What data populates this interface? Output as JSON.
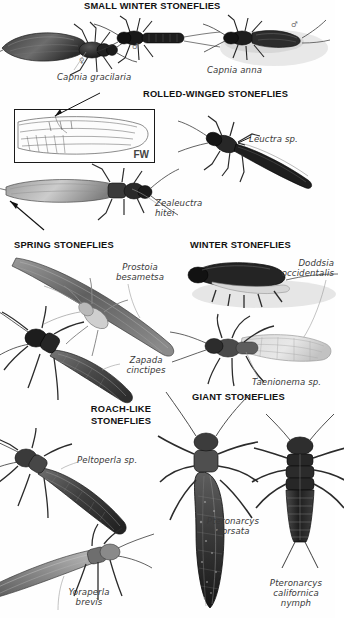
{
  "plate": {
    "title": "Stonefly families plate",
    "background_color": "#ffffff",
    "ink_color": "#1a1a1a",
    "label_color": "#3a3a3a"
  },
  "sections": [
    {
      "id": "small-winter",
      "heading": "SMALL WINTER STONEFLIES"
    },
    {
      "id": "rolled-winged",
      "heading": "ROLLED-WINGED STONEFLIES"
    },
    {
      "id": "spring",
      "heading": "SPRING STONEFLIES"
    },
    {
      "id": "winter",
      "heading": "WINTER STONEFLIES"
    },
    {
      "id": "roach-like",
      "heading": "ROACH-LIKE\nSTONEFLIES"
    },
    {
      "id": "giant",
      "heading": "GIANT STONEFLIES"
    }
  ],
  "specimens": [
    {
      "id": "capnia-gracilaria",
      "label": "Capnia gracilaria",
      "section": "small-winter",
      "sex": "♀"
    },
    {
      "id": "capnia-male",
      "label": "",
      "section": "small-winter",
      "sex": "♂"
    },
    {
      "id": "capnia-anna",
      "label": "Capnia anna",
      "section": "small-winter",
      "sex": "♂"
    },
    {
      "id": "zealeuctra-hitei",
      "label": "Zealeuctra\nhitei",
      "section": "rolled-winged",
      "sex": ""
    },
    {
      "id": "leuctra-sp",
      "label": "Leuctra sp.",
      "section": "rolled-winged",
      "sex": ""
    },
    {
      "id": "prostoia-besametsa",
      "label": "Prostoia\nbesametsa",
      "section": "spring",
      "sex": ""
    },
    {
      "id": "zapada-cinctipes",
      "label": "Zapada\ncinctipes",
      "section": "spring",
      "sex": ""
    },
    {
      "id": "doddsia-occidentalis",
      "label": "Doddsia\noccidentalis",
      "section": "winter",
      "sex": ""
    },
    {
      "id": "taenionema-sp",
      "label": "Taenionema sp.",
      "section": "winter",
      "sex": ""
    },
    {
      "id": "peltoperla-sp",
      "label": "Peltoperla sp.",
      "section": "roach-like",
      "sex": ""
    },
    {
      "id": "yoraperla-brevis",
      "label": "Yoraperla\nbrevis",
      "section": "roach-like",
      "sex": ""
    },
    {
      "id": "pteronarcys-dorsata",
      "label": "Pteronarcys\ndorsata",
      "section": "giant",
      "sex": ""
    },
    {
      "id": "pteronarcys-californica",
      "label": "Pteronarcys\ncalifornica\nnymph",
      "section": "giant",
      "sex": ""
    }
  ],
  "wing_inset": {
    "tag": "FW",
    "caption": "forewing venation detail"
  }
}
